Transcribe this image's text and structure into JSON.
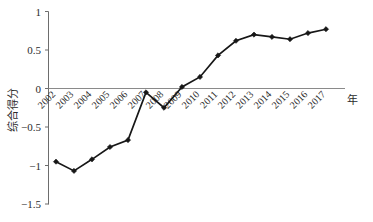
{
  "chart_data": {
    "type": "line",
    "title": "",
    "subtitle": "",
    "xlabel": "年",
    "ylabel": "综合得分",
    "categories": [
      "2002",
      "2003",
      "2004",
      "2005",
      "2006",
      "2007",
      "2008",
      "2009",
      "2010",
      "2011",
      "2012",
      "2013",
      "2014",
      "2015",
      "2016",
      "2017"
    ],
    "values": [
      -0.95,
      -1.07,
      -0.92,
      -0.76,
      -0.67,
      -0.05,
      -0.25,
      0.02,
      0.15,
      0.43,
      0.62,
      0.7,
      0.67,
      0.64,
      0.72,
      0.77
    ],
    "series": [
      {
        "name": "综合得分",
        "values": [
          -0.95,
          -1.07,
          -0.92,
          -0.76,
          -0.67,
          -0.05,
          -0.25,
          0.02,
          0.15,
          0.43,
          0.62,
          0.7,
          0.67,
          0.64,
          0.72,
          0.77
        ]
      }
    ],
    "ylim": [
      -1.5,
      1.0
    ],
    "yticks": [
      1,
      0.5,
      0,
      -0.5,
      -1,
      -1.5
    ],
    "ytick_labels": [
      "1",
      "0.5",
      "0",
      "−0.5",
      "−1",
      "−1.5"
    ],
    "xtick_labels": [
      "2002",
      "2003",
      "2004",
      "2005",
      "2006",
      "2007",
      "2008",
      "2009",
      "2010",
      "2011",
      "2012",
      "2013",
      "2014",
      "2015",
      "2016",
      "2017"
    ],
    "xtick_rotation_deg": -45,
    "grid": false,
    "legend": false,
    "legend_position": "none",
    "marker": "diamond",
    "line_color": "#171717",
    "axis_color": "#6d6d6d",
    "zero_line_color": "#8a8a8a",
    "background_color": "#ffffff",
    "annotations": []
  },
  "axis": {
    "y_title": "综合得分",
    "x_title": "年"
  },
  "yticks": {
    "t0": "1",
    "t1": "0.5",
    "t2": "0",
    "t3": "−0.5",
    "t4": "−1",
    "t5": "−1.5"
  },
  "xticks": {
    "t0": "2002",
    "t1": "2003",
    "t2": "2004",
    "t3": "2005",
    "t4": "2006",
    "t5": "2007",
    "t6": "2008",
    "t7": "2009",
    "t8": "2010",
    "t9": "2011",
    "t10": "2012",
    "t11": "2013",
    "t12": "2014",
    "t13": "2015",
    "t14": "2016",
    "t15": "2017"
  }
}
